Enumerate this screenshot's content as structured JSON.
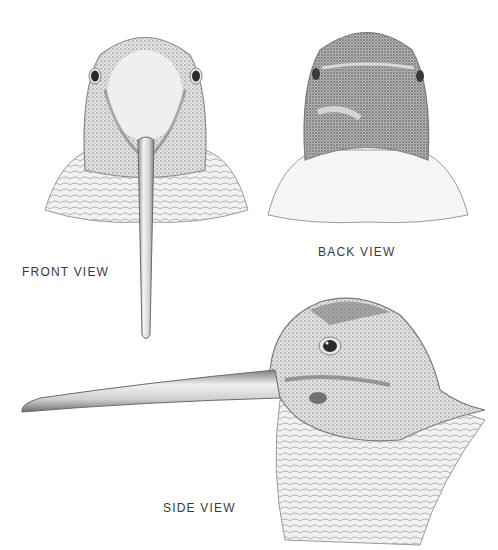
{
  "illustration": {
    "subject": "woodcock head",
    "style": "monochrome stipple engraving",
    "colors": {
      "background": "#ffffff",
      "ink": "#3a3a3a",
      "shade_dark": "#6b6b6b",
      "shade_mid": "#a6a6a6",
      "shade_light": "#d6d6d6"
    },
    "views": [
      {
        "id": "front",
        "label": "FRONT VIEW"
      },
      {
        "id": "back",
        "label": "BACK VIEW"
      },
      {
        "id": "side",
        "label": "SIDE VIEW"
      }
    ]
  }
}
